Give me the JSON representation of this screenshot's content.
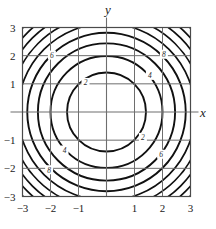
{
  "figure": {
    "axis_titles": {
      "x": "x",
      "y": "y"
    }
  },
  "chart_data": {
    "type": "line",
    "title": "",
    "xlabel": "x",
    "ylabel": "y",
    "xlim": [
      -3,
      3
    ],
    "ylim": [
      -3,
      3
    ],
    "grid": true,
    "legend": "none",
    "x_ticks": [
      -3,
      -2,
      -1,
      1,
      2,
      3
    ],
    "y_ticks": [
      3,
      2,
      1,
      -1,
      -2,
      -3
    ],
    "x_tick_labels": [
      "−3",
      "−2",
      "−1",
      "1",
      "2",
      "3"
    ],
    "y_tick_labels": [
      "3",
      "2",
      "1",
      "−1",
      "−2",
      "−3"
    ],
    "contour_levels": [
      2,
      4,
      6,
      8,
      10,
      12,
      14,
      16,
      18
    ],
    "contour_radii": [
      1.41,
      2.0,
      2.45,
      2.83,
      3.16,
      3.46,
      3.74,
      4.0,
      4.24
    ],
    "labeled_contours": [
      {
        "level": "2",
        "x": -0.75,
        "y": 1.05
      },
      {
        "level": "4",
        "x": 1.55,
        "y": 1.3
      },
      {
        "level": "6",
        "x": -1.95,
        "y": 2.02
      },
      {
        "level": "8",
        "x": 2.05,
        "y": 2.05
      },
      {
        "level": "2",
        "x": 1.3,
        "y": -0.9
      },
      {
        "level": "4",
        "x": -1.5,
        "y": -1.35
      },
      {
        "level": "6",
        "x": 1.95,
        "y": -1.5
      },
      {
        "level": "8",
        "x": -2.05,
        "y": -2.05
      }
    ],
    "colors": {
      "contour": "#111111",
      "grid": "#6e6e6e",
      "axis": "#6e6e6e",
      "frame": "#4a4a4a",
      "background": "#ffffff",
      "text": "#1a1a1a"
    }
  }
}
